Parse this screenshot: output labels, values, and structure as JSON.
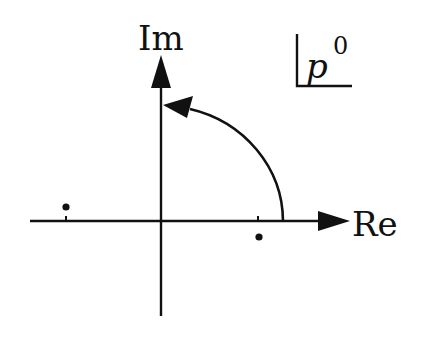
{
  "figure": {
    "type": "complex-plane-diagram",
    "axis_labels": {
      "imaginary": "Im",
      "real": "Re"
    },
    "plane_label": {
      "base": "p",
      "superscript": "0"
    },
    "points": [
      {
        "name": "left-pole",
        "position": "above real axis, left of origin"
      },
      {
        "name": "right-pole",
        "position": "below real axis, right of origin"
      }
    ],
    "contour": {
      "description": "quarter-circle arc from positive real axis to positive imaginary axis, counterclockwise"
    },
    "colors": {
      "ink": "#111111",
      "background": "#ffffff"
    }
  }
}
